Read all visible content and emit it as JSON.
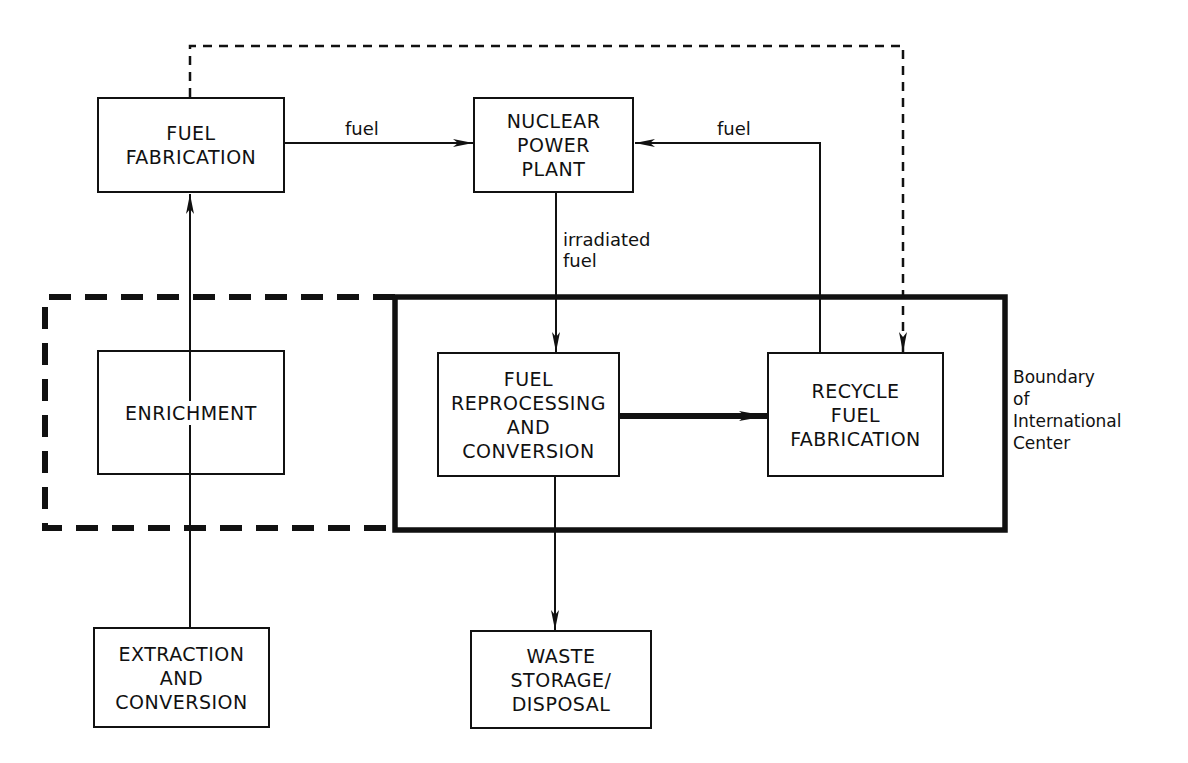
{
  "diagram": {
    "type": "nuclear fuel cycle flow diagram",
    "nodes": {
      "fuel_fabrication": {
        "label": "FUEL\nFABRICATION"
      },
      "nuclear_power_plant": {
        "label": "NUCLEAR\nPOWER\nPLANT"
      },
      "enrichment": {
        "label": "ENRICHMENT"
      },
      "fuel_reprocessing": {
        "label": "FUEL\nREPROCESSING\nAND\nCONVERSION"
      },
      "recycle_fuel_fabrication": {
        "label": "RECYCLE\nFUEL\nFABRICATION"
      },
      "extraction": {
        "label": "EXTRACTION\nAND\nCONVERSION"
      },
      "waste": {
        "label": "WASTE\nSTORAGE/\nDISPOSAL"
      }
    },
    "edges": [
      {
        "from": "extraction",
        "to": "fuel_fabrication",
        "via": "enrichment",
        "style": "solid",
        "label": ""
      },
      {
        "from": "fuel_fabrication",
        "to": "nuclear_power_plant",
        "style": "solid",
        "label": "fuel"
      },
      {
        "from": "recycle_fuel_fabrication",
        "to": "nuclear_power_plant",
        "style": "solid",
        "label": "fuel"
      },
      {
        "from": "nuclear_power_plant",
        "to": "fuel_reprocessing",
        "style": "solid",
        "label": "irradiated\nfuel"
      },
      {
        "from": "fuel_reprocessing",
        "to": "recycle_fuel_fabrication",
        "style": "thick",
        "label": ""
      },
      {
        "from": "fuel_reprocessing",
        "to": "waste",
        "style": "solid",
        "label": ""
      },
      {
        "from": "fuel_fabrication",
        "to": "recycle_fuel_fabrication",
        "style": "dashed",
        "label": ""
      }
    ],
    "edge_labels": {
      "fuel_to_plant": "fuel",
      "recycle_to_plant": "fuel",
      "irradiated": "irradiated\nfuel"
    },
    "boundaries": {
      "international_center": {
        "label": "Boundary\nof\nInternational\nCenter",
        "style": "solid-thick"
      },
      "optional_extension": {
        "label": "",
        "style": "dashed-thick"
      }
    },
    "colors": {
      "ink": "#111111",
      "background": "#ffffff"
    }
  }
}
